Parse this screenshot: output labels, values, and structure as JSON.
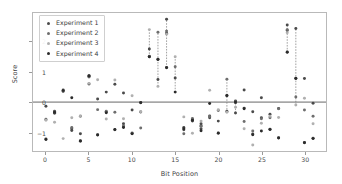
{
  "chart_data": {
    "type": "scatter",
    "title": "",
    "xlabel": "Bit Position",
    "ylabel": "Score",
    "xlim": [
      -1.5,
      32.5
    ],
    "ylim": [
      -1.62,
      2.95
    ],
    "xticks": [
      0,
      5,
      10,
      15,
      20,
      25,
      30
    ],
    "yticks": [
      -1,
      0,
      1,
      2
    ],
    "grid": false,
    "legend_position": "upper left",
    "zero_line": 0,
    "zero_line_color": "#555555",
    "series": [
      {
        "name": "Experiment 1",
        "color": "#4a4a4a",
        "marker": "circle",
        "points": [
          {
            "x": 0,
            "y": -0.14
          },
          {
            "x": 0,
            "y": -1.22
          },
          {
            "x": 1,
            "y": -0.3
          },
          {
            "x": 1,
            "y": -0.37
          },
          {
            "x": 2,
            "y": 0.37
          },
          {
            "x": 2,
            "y": 0.4
          },
          {
            "x": 3,
            "y": -0.88
          },
          {
            "x": 3,
            "y": -0.94
          },
          {
            "x": 4,
            "y": -1.05
          },
          {
            "x": 4,
            "y": -1.3
          },
          {
            "x": 5,
            "y": 0.85
          },
          {
            "x": 5,
            "y": 0.88
          },
          {
            "x": 5,
            "y": 0.6
          },
          {
            "x": 6,
            "y": 0.1
          },
          {
            "x": 6,
            "y": -1.08
          },
          {
            "x": 7,
            "y": 0.33
          },
          {
            "x": 7,
            "y": -0.33
          },
          {
            "x": 8,
            "y": 0.59
          },
          {
            "x": 8,
            "y": -0.92
          },
          {
            "x": 9,
            "y": 0.3
          },
          {
            "x": 9,
            "y": -0.72
          },
          {
            "x": 9,
            "y": -0.82
          },
          {
            "x": 10,
            "y": -0.26
          },
          {
            "x": 10,
            "y": -1.04
          },
          {
            "x": 11,
            "y": -0.01
          },
          {
            "x": 11,
            "y": -0.33
          },
          {
            "x": 12,
            "y": 1.76
          },
          {
            "x": 12,
            "y": 1.5
          },
          {
            "x": 13,
            "y": 1.42
          },
          {
            "x": 13,
            "y": 0.75
          },
          {
            "x": 14,
            "y": 2.74
          },
          {
            "x": 14,
            "y": 2.28
          },
          {
            "x": 14,
            "y": 1.15
          },
          {
            "x": 15,
            "y": 0.8
          },
          {
            "x": 16,
            "y": -0.84
          },
          {
            "x": 16,
            "y": -0.92
          },
          {
            "x": 17,
            "y": -0.58
          },
          {
            "x": 17,
            "y": -0.63
          },
          {
            "x": 18,
            "y": -0.72
          },
          {
            "x": 18,
            "y": -0.78
          },
          {
            "x": 18,
            "y": -0.88
          },
          {
            "x": 19,
            "y": -0.46
          },
          {
            "x": 19,
            "y": -0.52
          },
          {
            "x": 20,
            "y": -0.63
          },
          {
            "x": 20,
            "y": -1.02
          },
          {
            "x": 21,
            "y": 0.21
          },
          {
            "x": 21,
            "y": -0.3
          },
          {
            "x": 22,
            "y": 0.04
          },
          {
            "x": 22,
            "y": -0.02
          },
          {
            "x": 22,
            "y": -0.36
          },
          {
            "x": 23,
            "y": 0.4
          },
          {
            "x": 23,
            "y": -0.2
          },
          {
            "x": 24,
            "y": -0.32
          },
          {
            "x": 24,
            "y": -1.06
          },
          {
            "x": 25,
            "y": 0.14
          },
          {
            "x": 25,
            "y": -0.52
          },
          {
            "x": 26,
            "y": -0.4
          },
          {
            "x": 26,
            "y": -0.9
          },
          {
            "x": 27,
            "y": -0.21
          },
          {
            "x": 27,
            "y": -1.18
          },
          {
            "x": 28,
            "y": 2.55
          },
          {
            "x": 28,
            "y": 2.37
          },
          {
            "x": 28,
            "y": 1.66
          },
          {
            "x": 29,
            "y": 2.44
          },
          {
            "x": 29,
            "y": 0.79
          },
          {
            "x": 30,
            "y": 0.78
          },
          {
            "x": 30,
            "y": -1.34
          },
          {
            "x": 31,
            "y": -0.04
          },
          {
            "x": 31,
            "y": -1.2
          }
        ]
      },
      {
        "name": "Experiment 2",
        "color": "#6e6e6e",
        "marker": "circle",
        "points": [
          {
            "x": 0,
            "y": -0.57
          },
          {
            "x": 1,
            "y": -0.33
          },
          {
            "x": 2,
            "y": 0.35
          },
          {
            "x": 3,
            "y": -0.84
          },
          {
            "x": 4,
            "y": -0.47
          },
          {
            "x": 5,
            "y": 0.83
          },
          {
            "x": 6,
            "y": -0.25
          },
          {
            "x": 7,
            "y": -0.3
          },
          {
            "x": 8,
            "y": -0.34
          },
          {
            "x": 9,
            "y": -0.79
          },
          {
            "x": 10,
            "y": -1.02
          },
          {
            "x": 11,
            "y": -0.86
          },
          {
            "x": 12,
            "y": 1.52
          },
          {
            "x": 13,
            "y": 2.31
          },
          {
            "x": 14,
            "y": 2.35
          },
          {
            "x": 15,
            "y": 1.17
          },
          {
            "x": 16,
            "y": -1.05
          },
          {
            "x": 17,
            "y": -0.54
          },
          {
            "x": 18,
            "y": -0.8
          },
          {
            "x": 19,
            "y": -0.48
          },
          {
            "x": 20,
            "y": -0.28
          },
          {
            "x": 21,
            "y": 0.76
          },
          {
            "x": 22,
            "y": 0.02
          },
          {
            "x": 23,
            "y": -0.64
          },
          {
            "x": 24,
            "y": -0.96
          },
          {
            "x": 25,
            "y": -0.55
          },
          {
            "x": 26,
            "y": -0.52
          },
          {
            "x": 27,
            "y": -0.22
          },
          {
            "x": 28,
            "y": 2.4
          },
          {
            "x": 29,
            "y": 0.17
          },
          {
            "x": 30,
            "y": -0.26
          },
          {
            "x": 31,
            "y": -0.47
          }
        ]
      },
      {
        "name": "Experiment 3",
        "color": "#b0b0b0",
        "marker": "circle",
        "points": [
          {
            "x": 0,
            "y": -0.6
          },
          {
            "x": 1,
            "y": -0.67
          },
          {
            "x": 2,
            "y": -1.21
          },
          {
            "x": 3,
            "y": -0.52
          },
          {
            "x": 4,
            "y": -0.46
          },
          {
            "x": 5,
            "y": 0.62
          },
          {
            "x": 6,
            "y": 0.74
          },
          {
            "x": 7,
            "y": -0.56
          },
          {
            "x": 8,
            "y": 0.73
          },
          {
            "x": 9,
            "y": -0.55
          },
          {
            "x": 10,
            "y": 0.21
          },
          {
            "x": 11,
            "y": -0.32
          },
          {
            "x": 12,
            "y": 2.4
          },
          {
            "x": 13,
            "y": 0.52
          },
          {
            "x": 14,
            "y": 2.25
          },
          {
            "x": 15,
            "y": 1.5
          },
          {
            "x": 16,
            "y": -0.49
          },
          {
            "x": 17,
            "y": -1.03
          },
          {
            "x": 18,
            "y": -0.63
          },
          {
            "x": 19,
            "y": 0.39
          },
          {
            "x": 20,
            "y": -0.25
          },
          {
            "x": 21,
            "y": -0.34
          },
          {
            "x": 22,
            "y": -0.17
          },
          {
            "x": 23,
            "y": -0.88
          },
          {
            "x": 24,
            "y": -1.42
          },
          {
            "x": 25,
            "y": -0.7
          },
          {
            "x": 26,
            "y": -0.47
          },
          {
            "x": 27,
            "y": -0.51
          },
          {
            "x": 28,
            "y": 2.3
          },
          {
            "x": 29,
            "y": -0.1
          },
          {
            "x": 30,
            "y": 0.13
          },
          {
            "x": 31,
            "y": -0.72
          }
        ]
      },
      {
        "name": "Experiment 4",
        "color": "#2b2b2b",
        "marker": "circle",
        "points": [
          {
            "x": 0,
            "y": -1.24
          },
          {
            "x": 1,
            "y": -0.34
          },
          {
            "x": 2,
            "y": 0.38
          },
          {
            "x": 3,
            "y": 0.14
          },
          {
            "x": 4,
            "y": -1.28
          },
          {
            "x": 5,
            "y": 0.86
          },
          {
            "x": 6,
            "y": -1.09
          },
          {
            "x": 7,
            "y": -0.35
          },
          {
            "x": 8,
            "y": -0.91
          },
          {
            "x": 9,
            "y": -0.84
          },
          {
            "x": 10,
            "y": -1.05
          },
          {
            "x": 11,
            "y": -0.02
          },
          {
            "x": 12,
            "y": 1.5
          },
          {
            "x": 13,
            "y": 1.41
          },
          {
            "x": 14,
            "y": 1.14
          },
          {
            "x": 15,
            "y": 0.33
          },
          {
            "x": 16,
            "y": -0.88
          },
          {
            "x": 17,
            "y": -0.6
          },
          {
            "x": 18,
            "y": -0.95
          },
          {
            "x": 19,
            "y": -0.05
          },
          {
            "x": 20,
            "y": -1.03
          },
          {
            "x": 21,
            "y": 0.22
          },
          {
            "x": 22,
            "y": 0.0
          },
          {
            "x": 23,
            "y": -0.22
          },
          {
            "x": 24,
            "y": -1.08
          },
          {
            "x": 25,
            "y": -0.96
          },
          {
            "x": 26,
            "y": -0.91
          },
          {
            "x": 27,
            "y": -1.19
          },
          {
            "x": 28,
            "y": 1.65
          },
          {
            "x": 29,
            "y": 0.78
          },
          {
            "x": 30,
            "y": -1.35
          },
          {
            "x": 31,
            "y": -1.21
          }
        ]
      }
    ],
    "connector_lines": [
      {
        "x": 12,
        "y0": 1.5,
        "y1": 2.4
      },
      {
        "x": 13,
        "y0": 0.52,
        "y1": 2.31
      },
      {
        "x": 14,
        "y0": 1.14,
        "y1": 2.74
      },
      {
        "x": 15,
        "y0": 0.33,
        "y1": 1.5
      },
      {
        "x": 21,
        "y0": -0.34,
        "y1": 0.76
      },
      {
        "x": 22,
        "y0": -0.36,
        "y1": 0.04
      },
      {
        "x": 28,
        "y0": 1.65,
        "y1": 2.55
      },
      {
        "x": 29,
        "y0": -0.1,
        "y1": 2.44
      }
    ]
  }
}
